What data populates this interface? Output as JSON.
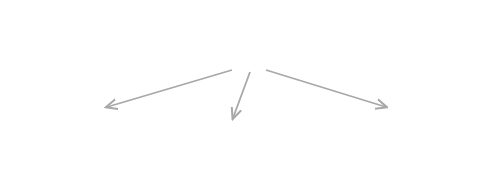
{
  "diagram": {
    "colors": {
      "stem": "#111111",
      "arrow": "#a8a8a8"
    },
    "top": {
      "symbol": "β",
      "axis_label": "Topics",
      "axis_end_label": "ℤ",
      "axis_end_sub": "+",
      "tick_labels": [
        "1",
        "2",
        "3",
        "4"
      ],
      "ellipsis": "···",
      "heights": [
        41,
        19,
        31,
        9,
        19,
        9,
        13
      ]
    },
    "documents": [
      {
        "symbol": "π",
        "superscript": "(1)",
        "tick_labels": [
          "1",
          "2",
          "3",
          "4"
        ],
        "ellipsis": "···",
        "axis_end_label": "ℤ",
        "axis_end_sub": "+",
        "heights": [
          46,
          33,
          25,
          12,
          23,
          6,
          9
        ]
      },
      {
        "symbol": "π",
        "superscript": "(2)",
        "tick_labels": [
          "1",
          "2",
          "3",
          "4"
        ],
        "ellipsis": "···",
        "axis_end_label": "ℤ",
        "axis_end_sub": "+",
        "heights": [
          33,
          22,
          35,
          7,
          15,
          17,
          9
        ]
      },
      {
        "symbol": "π",
        "superscript": "(D)",
        "tick_labels": [
          "1",
          "2",
          "3",
          "4"
        ],
        "ellipsis": "···",
        "axis_end_label": "ℤ",
        "axis_end_sub": "+",
        "heights": [
          29,
          45,
          31,
          6,
          14,
          11,
          25
        ]
      }
    ],
    "between_ellipsis": "· · ·"
  }
}
